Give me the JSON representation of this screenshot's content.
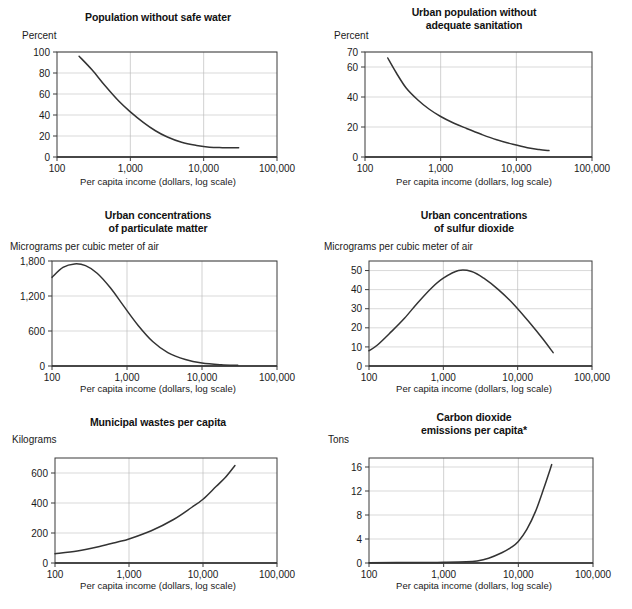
{
  "page": {
    "background": "#ffffff",
    "ink": "#1a1a1a",
    "curve_color": "#333333",
    "grid_color": "#c9c9c9"
  },
  "shared": {
    "xlabel": "Per capita income (dollars, log scale)",
    "x_ticks": [
      "100",
      "1,000",
      "10,000",
      "100,000"
    ],
    "x_values": [
      100,
      1000,
      10000,
      100000
    ],
    "xlim": [
      100,
      100000
    ]
  },
  "charts": [
    {
      "id": "population-without-safe-water",
      "title_lines": [
        "Population without safe water"
      ],
      "unit": "Percent",
      "y_ticks": [
        "0",
        "20",
        "40",
        "60",
        "80",
        "100"
      ],
      "y_values": [
        0,
        20,
        40,
        60,
        80,
        100
      ],
      "ylim": [
        0,
        100
      ]
    },
    {
      "id": "urban-population-without-adequate-sanitation",
      "title_lines": [
        "Urban population without",
        "adequate sanitation"
      ],
      "unit": "Percent",
      "y_ticks": [
        "0",
        "20",
        "40",
        "60",
        "70"
      ],
      "y_values": [
        0,
        20,
        40,
        60,
        70
      ],
      "ylim": [
        0,
        70
      ]
    },
    {
      "id": "urban-concentrations-of-particulate-matter",
      "title_lines": [
        "Urban concentrations",
        "of particulate matter"
      ],
      "unit": "Micrograms per cubic meter of air",
      "y_ticks": [
        "0",
        "600",
        "1,200",
        "1,800"
      ],
      "y_values": [
        0,
        600,
        1200,
        1800
      ],
      "ylim": [
        0,
        1800
      ]
    },
    {
      "id": "urban-concentrations-of-sulfur-dioxide",
      "title_lines": [
        "Urban concentrations",
        "of sulfur dioxide"
      ],
      "unit": "Micrograms per cubic meter of air",
      "y_ticks": [
        "0",
        "10",
        "20",
        "30",
        "40",
        "50"
      ],
      "y_values": [
        0,
        10,
        20,
        30,
        40,
        50
      ],
      "ylim": [
        0,
        55
      ]
    },
    {
      "id": "municipal-wastes-per-capita",
      "title_lines": [
        "Municipal wastes per capita"
      ],
      "unit": "Kilograms",
      "y_ticks": [
        "0",
        "200",
        "400",
        "600"
      ],
      "y_values": [
        0,
        200,
        400,
        600
      ],
      "ylim": [
        0,
        700
      ]
    },
    {
      "id": "carbon-dioxide-emissions-per-capita",
      "title_lines": [
        "Carbon dioxide",
        "emissions per capita*"
      ],
      "unit": "Tons",
      "y_ticks": [
        "0",
        "4",
        "8",
        "12",
        "16"
      ],
      "y_values": [
        0,
        4,
        8,
        12,
        16
      ],
      "ylim": [
        0,
        17.5
      ]
    }
  ],
  "chart_data": [
    {
      "type": "line",
      "title": "Population without safe water",
      "xlabel": "Per capita income (dollars, log scale)",
      "ylabel": "Percent",
      "xlim": [
        100,
        100000
      ],
      "ylim": [
        0,
        100
      ],
      "xlog": true,
      "grid": true,
      "legend": "none",
      "x": [
        200,
        300,
        450,
        700,
        1000,
        1500,
        2200,
        3200,
        5000,
        8000,
        12000,
        18000,
        30000
      ],
      "y": [
        96,
        83,
        68,
        53,
        43,
        33,
        25,
        19,
        14,
        11,
        9.3,
        8.9,
        8.8
      ]
    },
    {
      "type": "line",
      "title": "Urban population without adequate sanitation",
      "xlabel": "Per capita income (dollars, log scale)",
      "ylabel": "Percent",
      "xlim": [
        100,
        100000
      ],
      "ylim": [
        0,
        70
      ],
      "xlog": true,
      "grid": true,
      "legend": "none",
      "x": [
        200,
        260,
        350,
        500,
        700,
        1000,
        1500,
        2200,
        3500,
        5500,
        9000,
        14000,
        20000,
        27000
      ],
      "y": [
        66,
        56,
        46,
        38,
        32,
        27,
        22.5,
        19,
        15,
        11.5,
        8.5,
        6.2,
        5.0,
        4.3
      ]
    },
    {
      "type": "line",
      "title": "Urban concentrations of particulate matter",
      "xlabel": "Per capita income (dollars, log scale)",
      "ylabel": "Micrograms per cubic meter of air",
      "xlim": [
        100,
        100000
      ],
      "ylim": [
        0,
        1800
      ],
      "xlog": true,
      "grid": true,
      "legend": "none",
      "x": [
        100,
        140,
        200,
        280,
        400,
        600,
        900,
        1400,
        2200,
        3500,
        6000,
        10000,
        18000,
        30000
      ],
      "y": [
        1520,
        1690,
        1750,
        1720,
        1590,
        1340,
        1030,
        700,
        420,
        230,
        110,
        50,
        22,
        12
      ]
    },
    {
      "type": "line",
      "title": "Urban concentrations of sulfur dioxide",
      "xlabel": "Per capita income (dollars, log scale)",
      "ylabel": "Micrograms per cubic meter of air",
      "xlim": [
        100,
        100000
      ],
      "ylim": [
        0,
        55
      ],
      "xlog": true,
      "grid": true,
      "legend": "none",
      "x": [
        100,
        130,
        200,
        300,
        450,
        700,
        1000,
        1600,
        2400,
        3500,
        5500,
        9000,
        15000,
        22000,
        30000
      ],
      "y": [
        8,
        11,
        18,
        25,
        33,
        41,
        46,
        50,
        49.5,
        46,
        40,
        32,
        22,
        14,
        7
      ]
    },
    {
      "type": "line",
      "title": "Municipal wastes per capita",
      "xlabel": "Per capita income (dollars, log scale)",
      "ylabel": "Kilograms",
      "xlim": [
        100,
        100000
      ],
      "ylim": [
        0,
        700
      ],
      "xlog": true,
      "grid": true,
      "legend": "none",
      "x": [
        100,
        200,
        400,
        700,
        1000,
        2000,
        4000,
        7000,
        10000,
        15000,
        20000,
        27000
      ],
      "y": [
        62,
        80,
        110,
        140,
        160,
        215,
        290,
        370,
        425,
        510,
        570,
        650
      ]
    },
    {
      "type": "line",
      "title": "Carbon dioxide emissions per capita*",
      "xlabel": "Per capita income (dollars, log scale)",
      "ylabel": "Tons",
      "xlim": [
        100,
        100000
      ],
      "ylim": [
        0,
        17.5
      ],
      "xlog": true,
      "grid": true,
      "legend": "none",
      "x": [
        100,
        500,
        1000,
        2000,
        2800,
        4000,
        6000,
        8000,
        10000,
        13000,
        17000,
        22000,
        28000
      ],
      "y": [
        0.05,
        0.08,
        0.12,
        0.2,
        0.35,
        0.8,
        1.7,
        2.6,
        3.6,
        5.6,
        8.6,
        12.5,
        16.4
      ]
    }
  ]
}
